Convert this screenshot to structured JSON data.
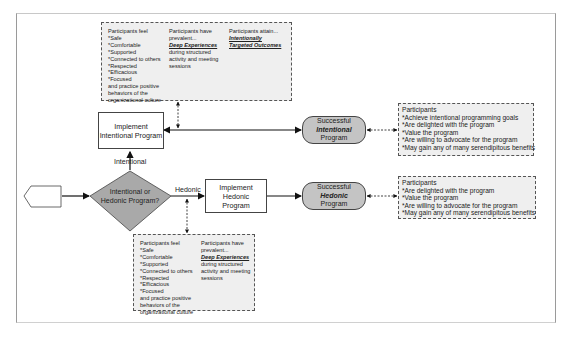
{
  "diagram": {
    "start_node": {
      "shape": "pentagon",
      "label": ""
    },
    "decision": {
      "line1": "Intentional or",
      "line2": "Hedonic Program?"
    },
    "branch_labels": {
      "intentional": "Intentional",
      "hedonic": "Hedonic"
    },
    "intentional_process": {
      "line1": "Implement",
      "line2": "Intentional Program"
    },
    "hedonic_process": {
      "line1": "Implement Hedonic",
      "line2": "Program"
    },
    "success_intentional": {
      "line1": "Successful",
      "line2": "Intentional",
      "line3": "Program"
    },
    "success_hedonic": {
      "line1": "Successful",
      "line2": "Hedonic",
      "line3": "Program"
    },
    "top_note": {
      "col1": [
        "Participants feel",
        "*Safe",
        "*Comfortable",
        "*Supported",
        "*Connected to others",
        "*Respected",
        "*Efficacious",
        "*Focused",
        "and practice positive",
        "behaviors of the",
        "organizational culture"
      ],
      "col2": {
        "intro": "Participants have",
        "intro2": "prevalent...",
        "emph": "Deep Experiences",
        "rest": [
          "during structured",
          "activity and meeting",
          "sessions"
        ]
      },
      "col3": {
        "intro": "Participants attain...",
        "emph1": "Intentionally",
        "emph2": "Targeted Outcomes"
      }
    },
    "bottom_note": {
      "col1": [
        "Participants feel",
        "*Safe",
        "*Comfortable",
        "*Supported",
        "*Connected to others",
        "*Respected",
        "*Efficacious",
        "*Focused",
        "and practice positive",
        "behaviors of the",
        "organizational culture"
      ],
      "col2": {
        "intro": "Participants have",
        "intro2": "prevalent...",
        "emph": "Deep Experiences",
        "rest": [
          "during structured",
          "activity and meeting",
          "sessions"
        ]
      }
    },
    "intentional_outcomes": [
      "Participants",
      "*Achieve intentional programming goals",
      "*Are delighted with the program",
      "*Value the program",
      "*Are willing to advocate for the program",
      "*May gain any of many serendipitous benefits"
    ],
    "hedonic_outcomes": [
      "Participants",
      "*Are delighted with the program",
      "*Value the program",
      "*Are willing to advocate for the program",
      "*May gain any of many serendipitous benefits"
    ],
    "colors": {
      "terminal_fill": "#c4c4c4",
      "decision_fill": "#a9a9a9",
      "note_fill": "#efefef",
      "line": "#222222"
    }
  }
}
